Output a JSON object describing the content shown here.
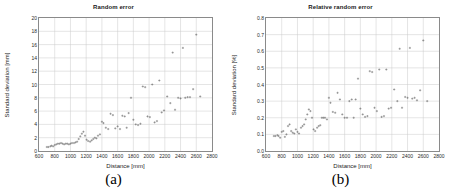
{
  "figure": {
    "panels": [
      {
        "caption": "(a)",
        "chart_data": {
          "type": "scatter",
          "title": "Random error",
          "xlabel": "Distance [mm]",
          "ylabel": "Standard deviation [mm]",
          "xlim": [
            600,
            2800
          ],
          "ylim": [
            0,
            20
          ],
          "xticks": [
            600,
            800,
            1000,
            1200,
            1400,
            1600,
            1800,
            2000,
            2200,
            2400,
            2600,
            2800
          ],
          "yticks": [
            0,
            2,
            4,
            6,
            8,
            10,
            12,
            14,
            16,
            18,
            20
          ],
          "grid": true,
          "legend": "none",
          "marker": "dot",
          "x": [
            700,
            720,
            745,
            760,
            780,
            800,
            820,
            840,
            860,
            880,
            900,
            920,
            940,
            960,
            980,
            1000,
            1020,
            1045,
            1065,
            1085,
            1105,
            1125,
            1145,
            1165,
            1185,
            1205,
            1225,
            1250,
            1270,
            1290,
            1310,
            1330,
            1350,
            1375,
            1400,
            1420,
            1450,
            1480,
            1510,
            1540,
            1570,
            1600,
            1630,
            1660,
            1690,
            1715,
            1740,
            1770,
            1800,
            1830,
            1860,
            1890,
            1920,
            1950,
            1980,
            2010,
            2040,
            2070,
            2100,
            2130,
            2160,
            2190,
            2230,
            2270,
            2300,
            2330,
            2370,
            2400,
            2430,
            2460,
            2490,
            2520,
            2560,
            2600,
            2650
          ],
          "y": [
            0.6,
            0.6,
            0.7,
            0.8,
            0.7,
            0.9,
            1.0,
            1.1,
            1.1,
            1.2,
            1.1,
            1.0,
            1.1,
            1.1,
            1.0,
            1.1,
            1.2,
            1.2,
            1.3,
            1.4,
            1.8,
            2.2,
            2.6,
            2.9,
            2.3,
            1.7,
            1.5,
            1.4,
            1.6,
            1.8,
            2.0,
            1.9,
            2.3,
            2.5,
            4.4,
            4.2,
            3.5,
            3.3,
            5.6,
            5.4,
            3.4,
            3.7,
            3.3,
            5.3,
            5.2,
            3.5,
            5.7,
            8.0,
            4.7,
            4.0,
            3.9,
            4.1,
            9.7,
            9.6,
            5.2,
            5.1,
            10.0,
            4.3,
            4.5,
            10.6,
            5.8,
            6.1,
            8.2,
            7.2,
            14.8,
            6.2,
            8.0,
            7.9,
            15.5,
            8.0,
            8.1,
            8.1,
            9.3,
            17.5,
            8.2
          ]
        }
      },
      {
        "caption": "(b)",
        "chart_data": {
          "type": "scatter",
          "title": "Relative random error",
          "xlabel": "Distance [mm]",
          "ylabel": "Standard deviation [%]",
          "xlim": [
            600,
            2800
          ],
          "ylim": [
            0,
            0.8
          ],
          "xticks": [
            600,
            800,
            1000,
            1200,
            1400,
            1600,
            1800,
            2000,
            2200,
            2400,
            2600,
            2800
          ],
          "yticks": [
            0,
            0.1,
            0.2,
            0.3,
            0.4,
            0.5,
            0.6,
            0.7,
            0.8
          ],
          "grid": true,
          "legend": "none",
          "marker": "dot",
          "x": [
            700,
            720,
            745,
            760,
            780,
            800,
            820,
            840,
            860,
            880,
            900,
            920,
            940,
            960,
            980,
            1000,
            1020,
            1045,
            1065,
            1085,
            1105,
            1125,
            1145,
            1165,
            1185,
            1205,
            1225,
            1250,
            1270,
            1290,
            1310,
            1330,
            1350,
            1375,
            1400,
            1420,
            1450,
            1480,
            1510,
            1540,
            1570,
            1600,
            1630,
            1660,
            1690,
            1715,
            1740,
            1770,
            1800,
            1830,
            1860,
            1890,
            1920,
            1950,
            1980,
            2010,
            2040,
            2070,
            2100,
            2130,
            2160,
            2190,
            2230,
            2270,
            2300,
            2330,
            2370,
            2400,
            2430,
            2460,
            2490,
            2520,
            2560,
            2600,
            2650
          ],
          "y": [
            0.09,
            0.09,
            0.095,
            0.09,
            0.08,
            0.115,
            0.12,
            0.085,
            0.1,
            0.15,
            0.16,
            0.12,
            0.11,
            0.105,
            0.13,
            0.115,
            0.105,
            0.14,
            0.15,
            0.16,
            0.19,
            0.22,
            0.25,
            0.24,
            0.2,
            0.13,
            0.12,
            0.14,
            0.15,
            0.155,
            0.2,
            0.2,
            0.2,
            0.19,
            0.32,
            0.29,
            0.235,
            0.23,
            0.35,
            0.31,
            0.22,
            0.2,
            0.2,
            0.3,
            0.31,
            0.2,
            0.31,
            0.435,
            0.255,
            0.22,
            0.205,
            0.21,
            0.48,
            0.475,
            0.26,
            0.24,
            0.49,
            0.205,
            0.21,
            0.49,
            0.255,
            0.26,
            0.37,
            0.3,
            0.615,
            0.26,
            0.325,
            0.32,
            0.62,
            0.315,
            0.32,
            0.305,
            0.365,
            0.665,
            0.3
          ]
        }
      }
    ]
  }
}
